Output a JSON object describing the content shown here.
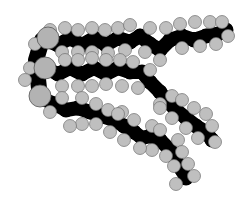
{
  "figure": {
    "colors": {
      "background": "#ffffff",
      "carbon_backbone": "#000000",
      "hydrogen": "#bfbfbf",
      "oxygen": "#b3b3b3"
    },
    "chains": [
      {
        "name": "top-chain",
        "backbone": [
          [
            45,
            40
          ],
          [
            58,
            45
          ],
          [
            70,
            38
          ],
          [
            82,
            45
          ],
          [
            94,
            38
          ],
          [
            106,
            45
          ],
          [
            118,
            38
          ],
          [
            130,
            42
          ],
          [
            140,
            36
          ],
          [
            150,
            44
          ],
          [
            160,
            50
          ],
          [
            170,
            40
          ],
          [
            182,
            36
          ],
          [
            194,
            40
          ],
          [
            206,
            36
          ],
          [
            218,
            34
          ],
          [
            226,
            30
          ]
        ],
        "hydrogens": [
          [
            35,
            44
          ],
          [
            50,
            30
          ],
          [
            65,
            28
          ],
          [
            78,
            30
          ],
          [
            92,
            28
          ],
          [
            105,
            30
          ],
          [
            118,
            28
          ],
          [
            130,
            25
          ],
          [
            150,
            28
          ],
          [
            166,
            28
          ],
          [
            180,
            24
          ],
          [
            195,
            22
          ],
          [
            210,
            22
          ],
          [
            222,
            22
          ],
          [
            228,
            36
          ],
          [
            216,
            44
          ],
          [
            200,
            46
          ],
          [
            182,
            48
          ],
          [
            160,
            60
          ],
          [
            145,
            52
          ],
          [
            125,
            50
          ],
          [
            108,
            53
          ],
          [
            92,
            52
          ],
          [
            78,
            52
          ],
          [
            62,
            52
          ]
        ]
      },
      {
        "name": "middle-chain",
        "backbone": [
          [
            45,
            68
          ],
          [
            58,
            74
          ],
          [
            70,
            68
          ],
          [
            82,
            74
          ],
          [
            94,
            68
          ],
          [
            106,
            74
          ],
          [
            118,
            68
          ],
          [
            130,
            72
          ],
          [
            142,
            72
          ],
          [
            150,
            82
          ],
          [
            160,
            92
          ],
          [
            168,
            102
          ],
          [
            176,
            110
          ],
          [
            186,
            118
          ],
          [
            196,
            126
          ],
          [
            206,
            132
          ],
          [
            212,
            140
          ]
        ],
        "hydrogens": [
          [
            30,
            68
          ],
          [
            65,
            60
          ],
          [
            78,
            60
          ],
          [
            92,
            58
          ],
          [
            106,
            60
          ],
          [
            120,
            60
          ],
          [
            133,
            62
          ],
          [
            150,
            70
          ],
          [
            62,
            86
          ],
          [
            78,
            86
          ],
          [
            92,
            86
          ],
          [
            106,
            84
          ],
          [
            122,
            86
          ],
          [
            138,
            88
          ],
          [
            160,
            104
          ],
          [
            172,
            96
          ],
          [
            182,
            100
          ],
          [
            194,
            108
          ],
          [
            206,
            114
          ],
          [
            212,
            126
          ],
          [
            215,
            142
          ],
          [
            160,
            108
          ],
          [
            172,
            118
          ],
          [
            186,
            128
          ],
          [
            198,
            138
          ]
        ]
      },
      {
        "name": "bottom-chain",
        "backbone": [
          [
            40,
            98
          ],
          [
            55,
            104
          ],
          [
            66,
            110
          ],
          [
            78,
            108
          ],
          [
            90,
            112
          ],
          [
            102,
            116
          ],
          [
            114,
            120
          ],
          [
            124,
            126
          ],
          [
            134,
            132
          ],
          [
            142,
            138
          ],
          [
            150,
            136
          ],
          [
            160,
            140
          ],
          [
            170,
            150
          ],
          [
            176,
            160
          ],
          [
            182,
            170
          ],
          [
            186,
            178
          ]
        ],
        "hydrogens": [
          [
            25,
            80
          ],
          [
            50,
            112
          ],
          [
            62,
            98
          ],
          [
            82,
            98
          ],
          [
            96,
            104
          ],
          [
            108,
            110
          ],
          [
            122,
            112
          ],
          [
            134,
            120
          ],
          [
            152,
            126
          ],
          [
            160,
            130
          ],
          [
            178,
            140
          ],
          [
            182,
            152
          ],
          [
            188,
            164
          ],
          [
            194,
            176
          ],
          [
            176,
            184
          ],
          [
            174,
            166
          ],
          [
            166,
            156
          ],
          [
            152,
            150
          ],
          [
            140,
            148
          ],
          [
            124,
            140
          ],
          [
            110,
            132
          ],
          [
            96,
            124
          ],
          [
            82,
            124
          ],
          [
            70,
            126
          ],
          [
            118,
            114
          ]
        ]
      }
    ],
    "oxygens": [
      [
        48,
        38
      ],
      [
        45,
        68
      ],
      [
        40,
        96
      ]
    ]
  }
}
